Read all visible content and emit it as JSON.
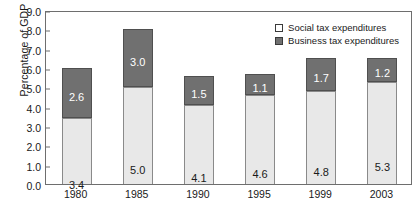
{
  "chart_data": {
    "type": "bar",
    "stacked": true,
    "title": "",
    "xlabel": "",
    "ylabel": "Percentage of GDP",
    "ylim": [
      0.0,
      9.0
    ],
    "ytick_step": 1.0,
    "grid": false,
    "legend_position": "top-right-inside",
    "categories": [
      "1980",
      "1985",
      "1990",
      "1995",
      "1999",
      "2003"
    ],
    "ytick_labels": [
      "0.0",
      "1.0",
      "2.0",
      "3.0",
      "4.0",
      "5.0",
      "6.0",
      "7.0",
      "8.0",
      "9.0"
    ],
    "ytick_values": [
      0.0,
      1.0,
      2.0,
      3.0,
      4.0,
      5.0,
      6.0,
      7.0,
      8.0,
      9.0
    ],
    "series": [
      {
        "name": "Social tax expenditures",
        "color": "#e8e8e8",
        "label_color": "#1a1a1a",
        "values": [
          3.4,
          5.0,
          4.1,
          4.6,
          4.8,
          5.3
        ],
        "labels": [
          "3.4",
          "5.0",
          "4.1",
          "4.6",
          "4.8",
          "5.3"
        ]
      },
      {
        "name": "Business tax expenditures",
        "color": "#707070",
        "label_color": "#ffffff",
        "values": [
          2.6,
          3.0,
          1.5,
          1.1,
          1.7,
          1.2
        ],
        "labels": [
          "2.6",
          "3.0",
          "1.5",
          "1.1",
          "1.7",
          "1.2"
        ]
      }
    ],
    "totals": [
      6.0,
      8.0,
      5.6,
      5.7,
      6.5,
      6.5
    ]
  },
  "legend": {
    "items": [
      {
        "label": "Social tax expenditures",
        "swatch": "social"
      },
      {
        "label": "Business tax expenditures",
        "swatch": "business"
      }
    ]
  }
}
